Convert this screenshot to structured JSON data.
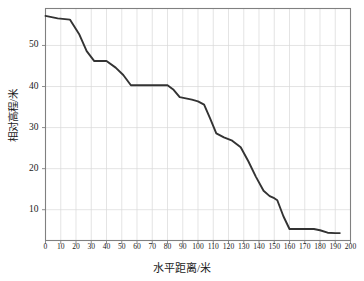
{
  "chart_data": {
    "type": "line",
    "title": "",
    "subtitle": "",
    "xlabel": "水平距离/米",
    "ylabel": "相对高程/米",
    "xlim": [
      0,
      200
    ],
    "ylim": [
      2.5,
      59
    ],
    "grid": true,
    "legend": null,
    "line_color": "#333333",
    "grid_color": "#d8d8d8",
    "axis_color": "#808080",
    "xticks": [
      0,
      10,
      20,
      30,
      40,
      50,
      60,
      70,
      80,
      90,
      100,
      110,
      120,
      130,
      140,
      150,
      160,
      170,
      180,
      190,
      200
    ],
    "yticks": [
      10,
      20,
      30,
      40,
      50
    ],
    "series": [
      {
        "name": "地形剖面",
        "x": [
          0,
          8,
          16,
          22,
          27,
          32,
          40,
          46,
          51,
          56,
          66,
          80,
          84,
          88,
          96,
          100,
          104,
          108,
          112,
          117,
          122,
          128,
          133,
          138,
          143,
          147,
          150,
          152,
          156,
          160,
          168,
          176,
          180,
          185,
          190,
          193
        ],
        "values": [
          57.2,
          56.6,
          56.3,
          52.8,
          48.6,
          46.2,
          46.2,
          44.6,
          42.8,
          40.3,
          40.3,
          40.3,
          39.2,
          37.4,
          36.8,
          36.4,
          35.6,
          32.2,
          28.6,
          27.6,
          26.9,
          25.2,
          21.8,
          18.0,
          14.6,
          13.3,
          12.8,
          12.3,
          8.4,
          5.3,
          5.3,
          5.3,
          5.0,
          4.4,
          4.3,
          4.3
        ]
      }
    ]
  }
}
